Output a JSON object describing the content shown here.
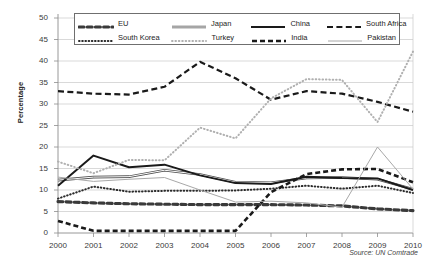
{
  "chart_data": {
    "type": "line",
    "title": "",
    "xlabel": "",
    "ylabel": "Percentage",
    "source": "Source: UN Comtrade",
    "legend_position": "top",
    "grid": true,
    "xlim": [
      2000,
      2010
    ],
    "ylim": [
      0,
      50
    ],
    "ytick_step": 5,
    "x": [
      2000,
      2001,
      2002,
      2003,
      2004,
      2005,
      2006,
      2007,
      2008,
      2009,
      2010
    ],
    "categories": [
      "2000",
      "2001",
      "2002",
      "2003",
      "2004",
      "2005",
      "2006",
      "2007",
      "2008",
      "2009",
      "2010"
    ],
    "yticks": [
      "0",
      "5",
      "10",
      "15",
      "20",
      "25",
      "30",
      "35",
      "40",
      "45",
      "50"
    ],
    "series": [
      {
        "name": "EU",
        "style": "dashed-oval",
        "color": "#3a3a3a",
        "values": [
          7.3,
          7.0,
          6.8,
          6.7,
          6.6,
          6.6,
          6.6,
          6.5,
          6.3,
          5.6,
          5.2
        ]
      },
      {
        "name": "Japan",
        "style": "double-line",
        "color": "#4d4d4d",
        "values": [
          12.3,
          13.0,
          13.1,
          14.6,
          13.6,
          11.8,
          11.7,
          12.8,
          12.9,
          12.5,
          10.2
        ]
      },
      {
        "name": "China",
        "style": "solid-thick",
        "color": "#1a1a1a",
        "values": [
          11.0,
          18.0,
          15.3,
          15.9,
          13.4,
          11.6,
          11.4,
          13.1,
          12.8,
          12.7,
          10.0
        ]
      },
      {
        "name": "South Africa",
        "style": "dashed-thick",
        "color": "#1a1a1a",
        "values": [
          33.0,
          32.4,
          32.2,
          34.0,
          39.8,
          36.0,
          31.0,
          33.0,
          32.4,
          30.5,
          28.2
        ]
      },
      {
        "name": "South Korea",
        "style": "dotted-round",
        "color": "#2b2b2b",
        "values": [
          8.0,
          10.8,
          9.6,
          9.8,
          9.8,
          9.9,
          10.3,
          11.0,
          10.3,
          11.0,
          9.3
        ]
      },
      {
        "name": "Turkey",
        "style": "dotted-light",
        "color": "#b0b0b0",
        "values": [
          16.6,
          13.9,
          17.0,
          16.9,
          24.5,
          22.0,
          31.3,
          35.8,
          35.6,
          25.8,
          42.2
        ]
      },
      {
        "name": "India",
        "style": "dashed-bold",
        "color": "#1a1a1a",
        "values": [
          2.8,
          0.5,
          0.5,
          0.5,
          0.5,
          0.5,
          9.5,
          13.7,
          14.8,
          14.9,
          11.8
        ]
      },
      {
        "name": "Pakistan",
        "style": "thin-gray",
        "color": "#a8a8a8",
        "values": [
          13.0,
          12.0,
          12.5,
          12.9,
          10.0,
          7.2,
          7.4,
          7.0,
          6.0,
          20.0,
          10.2
        ]
      }
    ]
  },
  "legend": {
    "rows": [
      [
        {
          "label": "EU",
          "key": "eu"
        },
        {
          "label": "Japan",
          "key": "japan"
        },
        {
          "label": "China",
          "key": "china"
        },
        {
          "label": "South Africa",
          "key": "south-africa"
        }
      ],
      [
        {
          "label": "South Korea",
          "key": "south-korea"
        },
        {
          "label": "Turkey",
          "key": "turkey"
        },
        {
          "label": "India",
          "key": "india"
        },
        {
          "label": "Pakistan",
          "key": "pakistan"
        }
      ]
    ]
  }
}
